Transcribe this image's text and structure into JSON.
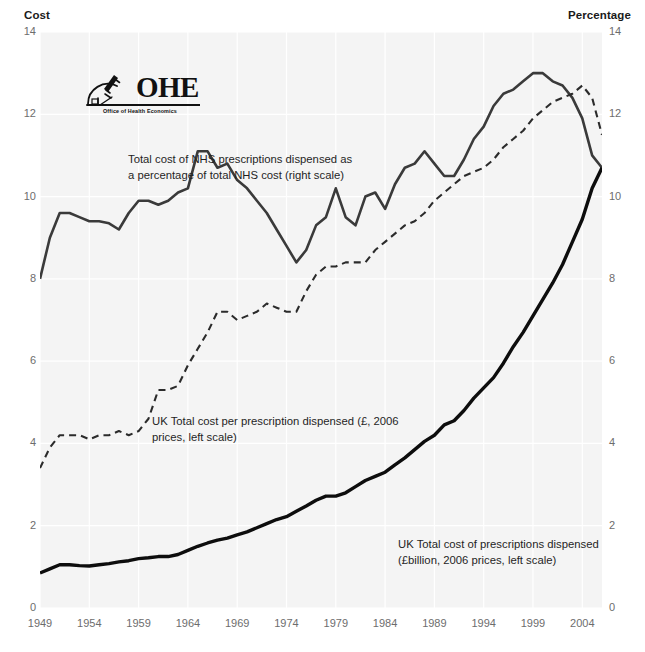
{
  "axes": {
    "left_title": "Cost",
    "right_title": "Percentage",
    "left_ticks": [
      "14",
      "12",
      "10",
      "8",
      "6",
      "4",
      "2",
      "0"
    ],
    "right_ticks": [
      "14",
      "12",
      "10",
      "8",
      "6",
      "4",
      "2",
      "0"
    ],
    "x_ticks": [
      "1949",
      "1954",
      "1959",
      "1964",
      "1969",
      "1974",
      "1979",
      "1984",
      "1989",
      "1994",
      "1999",
      "2004"
    ]
  },
  "logo": {
    "word": "OHE",
    "subtitle": "Office of Health Economics",
    "icon": "microscope-icon"
  },
  "annotations": {
    "percentage": "Total cost of NHS prescriptions dispensed as\na percentage of total NHS cost (right scale)",
    "cost_per_prescription": "UK Total cost per prescription dispensed (£, 2006\nprices, left scale)",
    "total_cost": "UK Total cost of prescriptions dispensed\n(£billion, 2006 prices, left scale)"
  },
  "colors": {
    "plot_background": "#f4f4f4",
    "gridline": "#ffffff",
    "series_solid_thin": "#3a3a3a",
    "series_dashed": "#2b2b2b",
    "series_solid_thick": "#0d0d0d",
    "tick_text": "#6d6d6d",
    "title_text": "#1a1a1a"
  },
  "chart_data": {
    "type": "line",
    "title": "",
    "xlabel": "",
    "ylabel": "Cost",
    "y2label": "Percentage",
    "xlim": [
      1949,
      2006
    ],
    "ylim": [
      0,
      14
    ],
    "y2lim": [
      0,
      14
    ],
    "grid": true,
    "legend_position": "inline-annotations",
    "x": [
      1949,
      1950,
      1951,
      1952,
      1953,
      1954,
      1955,
      1956,
      1957,
      1958,
      1959,
      1960,
      1961,
      1962,
      1963,
      1964,
      1965,
      1966,
      1967,
      1968,
      1969,
      1970,
      1971,
      1972,
      1973,
      1974,
      1975,
      1976,
      1977,
      1978,
      1979,
      1980,
      1981,
      1982,
      1983,
      1984,
      1985,
      1986,
      1987,
      1988,
      1989,
      1990,
      1991,
      1992,
      1993,
      1994,
      1995,
      1996,
      1997,
      1998,
      1999,
      2000,
      2001,
      2002,
      2003,
      2004,
      2005,
      2006
    ],
    "series": [
      {
        "name": "Total cost of NHS prescriptions dispensed as a percentage of total NHS cost (right scale)",
        "axis": "right",
        "units": "percent",
        "style": "solid-thin",
        "values": [
          8.0,
          9.0,
          9.6,
          9.6,
          9.5,
          9.4,
          9.4,
          9.35,
          9.2,
          9.6,
          9.9,
          9.9,
          9.8,
          9.9,
          10.1,
          10.2,
          11.1,
          11.1,
          10.7,
          10.8,
          10.4,
          10.2,
          9.9,
          9.6,
          9.2,
          8.8,
          8.4,
          8.7,
          9.3,
          9.5,
          10.2,
          9.5,
          9.3,
          10.0,
          10.1,
          9.7,
          10.3,
          10.7,
          10.8,
          11.1,
          10.8,
          10.5,
          10.5,
          10.9,
          11.4,
          11.7,
          12.2,
          12.5,
          12.6,
          12.8,
          13.0,
          13.0,
          12.8,
          12.7,
          12.4,
          11.9,
          11.0,
          10.7
        ]
      },
      {
        "name": "UK Total cost per prescription dispensed (£, 2006 prices, left scale)",
        "axis": "left",
        "units": "GBP",
        "style": "dashed",
        "values": [
          3.4,
          3.9,
          4.2,
          4.2,
          4.2,
          4.1,
          4.2,
          4.2,
          4.3,
          4.2,
          4.3,
          4.6,
          5.3,
          5.3,
          5.4,
          5.9,
          6.3,
          6.7,
          7.2,
          7.2,
          7.0,
          7.1,
          7.2,
          7.4,
          7.3,
          7.2,
          7.2,
          7.7,
          8.1,
          8.3,
          8.3,
          8.4,
          8.4,
          8.4,
          8.7,
          8.9,
          9.1,
          9.3,
          9.4,
          9.6,
          9.9,
          10.1,
          10.3,
          10.5,
          10.6,
          10.7,
          10.9,
          11.2,
          11.4,
          11.6,
          11.9,
          12.1,
          12.3,
          12.4,
          12.5,
          12.7,
          12.4,
          11.5
        ]
      },
      {
        "name": "UK Total cost of prescriptions dispensed (£billion, 2006 prices, left scale)",
        "axis": "left",
        "units": "GBP billion",
        "style": "solid-thick",
        "values": [
          0.85,
          0.95,
          1.05,
          1.05,
          1.03,
          1.02,
          1.05,
          1.08,
          1.12,
          1.15,
          1.2,
          1.22,
          1.25,
          1.25,
          1.3,
          1.4,
          1.5,
          1.58,
          1.65,
          1.7,
          1.78,
          1.85,
          1.95,
          2.05,
          2.15,
          2.22,
          2.35,
          2.48,
          2.62,
          2.72,
          2.72,
          2.8,
          2.95,
          3.1,
          3.2,
          3.3,
          3.48,
          3.65,
          3.85,
          4.05,
          4.2,
          4.45,
          4.55,
          4.8,
          5.1,
          5.35,
          5.6,
          5.95,
          6.35,
          6.7,
          7.1,
          7.5,
          7.9,
          8.35,
          8.9,
          9.45,
          10.2,
          10.7
        ]
      }
    ]
  }
}
